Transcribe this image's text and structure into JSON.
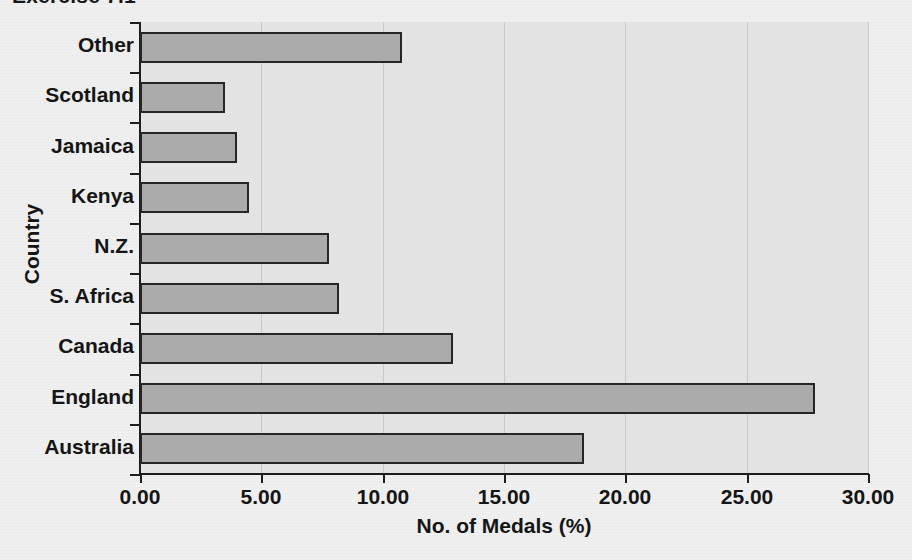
{
  "chart_data": {
    "type": "bar",
    "orientation": "horizontal",
    "title": "Exercise 7.1",
    "xlabel": "No. of Medals (%)",
    "ylabel": "Country",
    "categories": [
      "Australia",
      "England",
      "Canada",
      "S. Africa",
      "N.Z.",
      "Kenya",
      "Jamaica",
      "Scotland",
      "Other"
    ],
    "values": [
      18.3,
      27.8,
      12.9,
      8.2,
      7.8,
      4.5,
      4.0,
      3.5,
      10.8
    ],
    "xlim": [
      0,
      30
    ],
    "xticks": [
      0,
      5,
      10,
      15,
      20,
      25,
      30
    ],
    "xtick_labels": [
      "0.00",
      "5.00",
      "10.00",
      "15.00",
      "20.00",
      "25.00",
      "30.00"
    ],
    "grid": true,
    "grid_axis": "x",
    "legend": false,
    "bar_fill_color": "#ababab",
    "bar_edge_color": "#262626",
    "plot_background_color": "#e3e3e3",
    "page_background_color": "#efefef"
  }
}
